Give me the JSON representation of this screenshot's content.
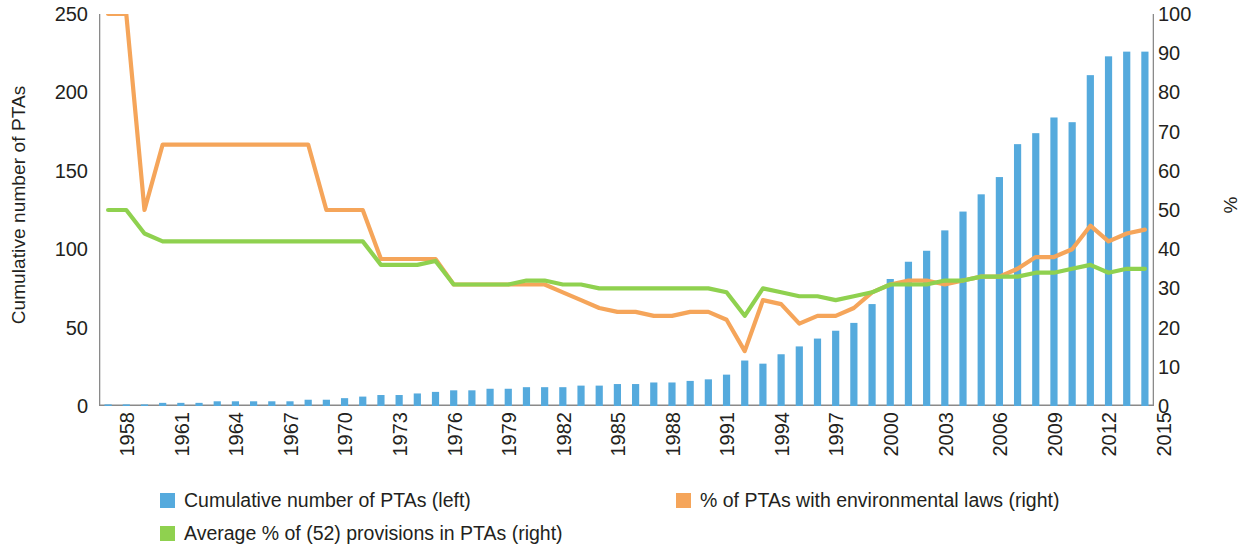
{
  "axes": {
    "left_title": "Cumulative number of PTAs",
    "right_title": "%",
    "left_ticks": [
      0,
      50,
      100,
      150,
      200,
      250
    ],
    "right_ticks": [
      0,
      10,
      20,
      30,
      40,
      50,
      60,
      70,
      80,
      90,
      100
    ],
    "x_ticks": [
      "1958",
      "1961",
      "1964",
      "1967",
      "1970",
      "1973",
      "1976",
      "1979",
      "1982",
      "1985",
      "1988",
      "1991",
      "1994",
      "1997",
      "2000",
      "2003",
      "2006",
      "2009",
      "2012",
      "2015"
    ]
  },
  "colors": {
    "bar_blue": "#55aadd",
    "line_orange": "#f5a55a",
    "line_green": "#8fd14f",
    "axis": "#8a8a8a",
    "text": "#231f20"
  },
  "legend": {
    "items": [
      {
        "label": "Cumulative number of PTAs (left)",
        "color": "#55aadd",
        "slot": 0
      },
      {
        "label": "Average % of (52) provisions in PTAs (right)",
        "color": "#8fd14f",
        "slot": 1
      },
      {
        "label": "% of PTAs with environmental laws (right)",
        "color": "#f5a55a",
        "slot": 2
      }
    ]
  },
  "chart_data": {
    "type": "bar",
    "title": "",
    "xlabel": "",
    "ylabel": "Cumulative number of PTAs",
    "y2label": "%",
    "ylim": [
      0,
      250
    ],
    "y2lim": [
      0,
      100
    ],
    "grid": false,
    "legend_position": "bottom",
    "categories": [
      1958,
      1959,
      1960,
      1961,
      1962,
      1963,
      1964,
      1965,
      1966,
      1967,
      1968,
      1969,
      1970,
      1971,
      1972,
      1973,
      1974,
      1975,
      1976,
      1977,
      1978,
      1979,
      1980,
      1981,
      1982,
      1983,
      1984,
      1985,
      1986,
      1987,
      1988,
      1989,
      1990,
      1991,
      1992,
      1993,
      1994,
      1995,
      1996,
      1997,
      1998,
      1999,
      2000,
      2001,
      2002,
      2003,
      2004,
      2005,
      2006,
      2007,
      2008,
      2009,
      2010,
      2011,
      2012,
      2013,
      2014,
      2015
    ],
    "series": [
      {
        "name": "Cumulative number of PTAs (left)",
        "type": "bar",
        "axis": "left",
        "color": "#55aadd",
        "values": [
          1,
          1,
          1,
          2,
          2,
          2,
          3,
          3,
          3,
          3,
          3,
          4,
          4,
          5,
          6,
          7,
          7,
          8,
          9,
          10,
          10,
          11,
          11,
          12,
          12,
          12,
          13,
          13,
          14,
          14,
          15,
          15,
          16,
          17,
          20,
          29,
          27,
          33,
          38,
          43,
          48,
          53,
          65,
          81,
          92,
          99,
          112,
          124,
          135,
          146,
          167,
          174,
          184,
          181,
          211,
          223,
          226,
          226
        ]
      },
      {
        "name": "% of PTAs with environmental laws (right)",
        "type": "line",
        "axis": "right",
        "color": "#f5a55a",
        "values": [
          100,
          100,
          50,
          66.7,
          66.7,
          66.7,
          66.7,
          66.7,
          66.7,
          66.7,
          66.7,
          66.7,
          50,
          50,
          50,
          37.5,
          37.5,
          37.5,
          37.5,
          31,
          31,
          31,
          31,
          31,
          31,
          29,
          27,
          25,
          24,
          24,
          23,
          23,
          24,
          24,
          22,
          14,
          27,
          26,
          21,
          23,
          23,
          25,
          29,
          31,
          32,
          32,
          31,
          32,
          33,
          33,
          35,
          38,
          38,
          40,
          46,
          42,
          44,
          45
        ]
      },
      {
        "name": "Average % of (52) provisions in PTAs (right)",
        "type": "line",
        "axis": "right",
        "color": "#8fd14f",
        "values": [
          50,
          50,
          44,
          42,
          42,
          42,
          42,
          42,
          42,
          42,
          42,
          42,
          42,
          42,
          42,
          36,
          36,
          36,
          37,
          31,
          31,
          31,
          31,
          32,
          32,
          31,
          31,
          30,
          30,
          30,
          30,
          30,
          30,
          30,
          29,
          23,
          30,
          29,
          28,
          28,
          27,
          28,
          29,
          31,
          31,
          31,
          32,
          32,
          33,
          33,
          33,
          34,
          34,
          35,
          36,
          34,
          35,
          35
        ]
      }
    ]
  }
}
